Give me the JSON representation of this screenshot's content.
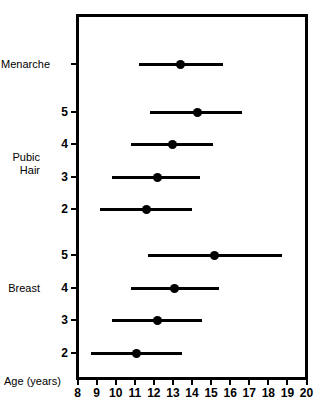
{
  "chart_data": {
    "type": "line",
    "subtype": "range-interval-plot",
    "title": "",
    "xlabel": "Age (years)",
    "ylabel": "",
    "xlim": [
      8,
      20
    ],
    "xticks": [
      8,
      9,
      10,
      11,
      12,
      13,
      14,
      15,
      16,
      17,
      18,
      19,
      20
    ],
    "xticklabels": [
      "8",
      "9",
      "10",
      "11",
      "12",
      "13",
      "14",
      "15",
      "16",
      "17",
      "18",
      "19",
      "20"
    ],
    "grid": false,
    "legend": null,
    "group_labels": [
      {
        "text": "Menarche",
        "row": "menarche"
      },
      {
        "text": "Pubic\nHair",
        "row": "pubic-hair"
      },
      {
        "text": "Breast",
        "row": "breast"
      }
    ],
    "categories": [
      "Menarche",
      "Pubic Hair 5",
      "Pubic Hair 4",
      "Pubic Hair 3",
      "Pubic Hair 2",
      "Breast 5",
      "Breast 4",
      "Breast 3",
      "Breast 2"
    ],
    "rows": [
      {
        "id": "menarche",
        "group": "Menarche",
        "stage": "",
        "tick_label": "",
        "start": 11.2,
        "mean": 13.4,
        "end": 15.6
      },
      {
        "id": "pubic-hair-5",
        "group": "Pubic Hair",
        "stage": "5",
        "tick_label": "5",
        "start": 11.8,
        "mean": 14.3,
        "end": 16.6
      },
      {
        "id": "pubic-hair-4",
        "group": "Pubic Hair",
        "stage": "4",
        "tick_label": "4",
        "start": 10.8,
        "mean": 13.0,
        "end": 15.1
      },
      {
        "id": "pubic-hair-3",
        "group": "Pubic Hair",
        "stage": "3",
        "tick_label": "3",
        "start": 9.8,
        "mean": 12.2,
        "end": 14.4
      },
      {
        "id": "pubic-hair-2",
        "group": "Pubic Hair",
        "stage": "2",
        "tick_label": "2",
        "start": 9.2,
        "mean": 11.6,
        "end": 14.0
      },
      {
        "id": "breast-5",
        "group": "Breast",
        "stage": "5",
        "tick_label": "5",
        "start": 11.7,
        "mean": 15.2,
        "end": 18.7
      },
      {
        "id": "breast-4",
        "group": "Breast",
        "stage": "4",
        "tick_label": "4",
        "start": 10.8,
        "mean": 13.1,
        "end": 15.4
      },
      {
        "id": "breast-3",
        "group": "Breast",
        "stage": "3",
        "tick_label": "3",
        "start": 9.8,
        "mean": 12.2,
        "end": 14.5
      },
      {
        "id": "breast-2",
        "group": "Breast",
        "stage": "2",
        "tick_label": "2",
        "start": 8.7,
        "mean": 11.1,
        "end": 13.5
      }
    ],
    "colors": {
      "line": "#000000",
      "marker": "#000000",
      "axis": "#000000",
      "background": "#ffffff"
    }
  },
  "labels": {
    "menarche": "Menarche",
    "pubic_hair": "Pubic\nHair",
    "breast": "Breast",
    "age_years": "Age (years)"
  }
}
